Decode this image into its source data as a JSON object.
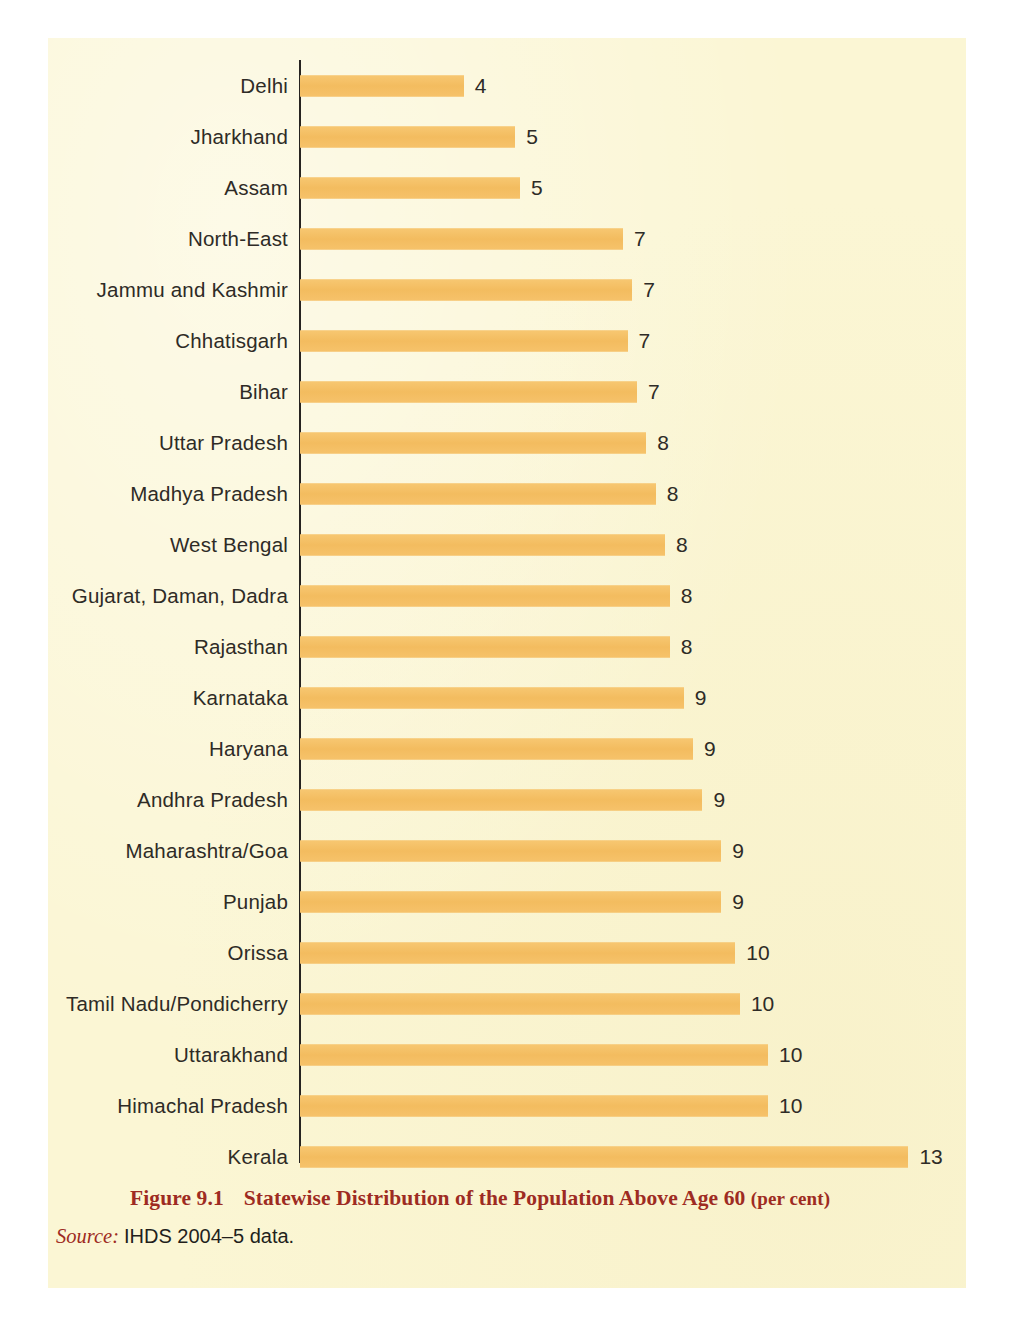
{
  "figure": {
    "caption_number": "Figure 9.1",
    "caption_title": "Statewise Distribution of the Population Above Age 60",
    "caption_unit": "(per cent)",
    "source_word": "Source:",
    "source_text": "IHDS 2004–5 data."
  },
  "colors": {
    "bar": "#F6C26A",
    "page": "#FBF6D4",
    "axis": "#262320",
    "label_text": "#2E2B26",
    "caption_red": "#9E2B22"
  },
  "chart_data": {
    "type": "bar",
    "orientation": "horizontal",
    "title": "Statewise Distribution of the Population Above Age 60 (per cent)",
    "xlabel": "",
    "ylabel": "",
    "xlim": [
      0,
      13.5
    ],
    "grid": false,
    "legend": "none",
    "axis_line": "left",
    "categories": [
      "Delhi",
      "Jharkhand",
      "Assam",
      "North-East",
      "Jammu and Kashmir",
      "Chhatisgarh",
      "Bihar",
      "Uttar Pradesh",
      "Madhya Pradesh",
      "West Bengal",
      "Gujarat, Daman, Dadra",
      "Rajasthan",
      "Karnataka",
      "Haryana",
      "Andhra Pradesh",
      "Maharashtra/Goa",
      "Punjab",
      "Orissa",
      "Tamil Nadu/Pondicherry",
      "Uttarakhand",
      "Himachal Pradesh",
      "Kerala"
    ],
    "values": [
      3.5,
      4.6,
      4.7,
      6.9,
      7.1,
      7.0,
      7.2,
      7.4,
      7.6,
      7.8,
      7.9,
      7.9,
      8.2,
      8.4,
      8.6,
      9.0,
      9.0,
      9.3,
      9.4,
      10.0,
      10.0,
      13.0
    ],
    "value_labels": [
      "4",
      "5",
      "5",
      "7",
      "7",
      "7",
      "7",
      "8",
      "8",
      "8",
      "8",
      "8",
      "9",
      "9",
      "9",
      "9",
      "9",
      "10",
      "10",
      "10",
      "10",
      "13"
    ]
  }
}
